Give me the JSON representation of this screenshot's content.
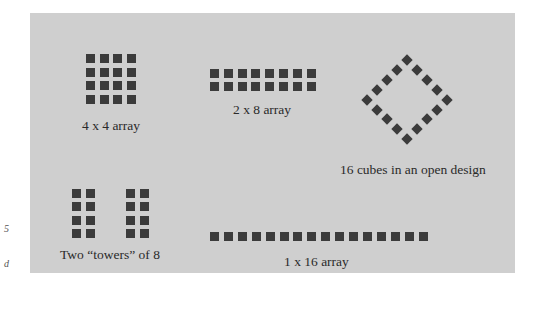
{
  "edge_fragments": [
    {
      "text": "5",
      "x": 4,
      "y": 229
    },
    {
      "text": "d",
      "x": 4,
      "y": 264
    }
  ],
  "colors": {
    "panel_background": "#cfcfcf",
    "cube": "#3b3b3b",
    "label_text": "#2a2a2a",
    "page_background": "#ffffff"
  },
  "arrangements": [
    {
      "id": "4x4",
      "label": "4 x 4 array",
      "rows": 4,
      "cols": 4,
      "cube_count": 16
    },
    {
      "id": "2x8",
      "label": "2 x 8 array",
      "rows": 2,
      "cols": 8,
      "cube_count": 16
    },
    {
      "id": "open",
      "label": "16 cubes in an open design",
      "shape": "diamond outline",
      "cube_count": 16
    },
    {
      "id": "towers",
      "label": "Two “towers” of 8",
      "towers": 2,
      "rows_per_tower": 4,
      "cols_per_tower": 2,
      "cube_count": 16
    },
    {
      "id": "1x16",
      "label": "1 x 16 array",
      "rows": 1,
      "cols": 16,
      "cube_count": 16
    }
  ]
}
